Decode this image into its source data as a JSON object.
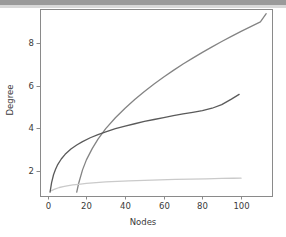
{
  "figure": {
    "background_color": "#ffffff",
    "top_band_color": "#9a9a9a",
    "axes_frame_color": "#8a8a8a"
  },
  "chart_data": {
    "type": "line",
    "title": "",
    "xlabel": "Nodes",
    "ylabel": "Degree",
    "xlim": [
      -4,
      116
    ],
    "ylim": [
      0.82,
      9.62
    ],
    "xticks": [
      0,
      20,
      40,
      60,
      80,
      100
    ],
    "xticklabels": [
      "0",
      "20",
      "40",
      "60",
      "80",
      "100"
    ],
    "yticks": [
      2,
      4,
      6,
      8
    ],
    "yticklabels": [
      "2",
      "4",
      "6",
      "8"
    ],
    "grid": false,
    "legend": null,
    "series": [
      {
        "name": "steep-curve",
        "color": "#848484",
        "linewidth": 1.3,
        "x": [
          15,
          16,
          18,
          20,
          23,
          26,
          30,
          35,
          40,
          45,
          50,
          55,
          60,
          65,
          70,
          75,
          80,
          85,
          90,
          95,
          100,
          105,
          110,
          113
        ],
        "y": [
          1.0,
          1.42,
          2.05,
          2.52,
          3.05,
          3.5,
          3.99,
          4.5,
          4.95,
          5.36,
          5.74,
          6.09,
          6.42,
          6.73,
          7.03,
          7.31,
          7.58,
          7.84,
          8.09,
          8.33,
          8.57,
          8.79,
          9.01,
          9.4
        ]
      },
      {
        "name": "dark-curve",
        "color": "#5a5a5a",
        "linewidth": 1.3,
        "x": [
          1.2,
          2,
          3,
          4,
          5,
          7,
          9,
          12,
          15,
          18,
          22,
          26,
          30,
          35,
          40,
          45,
          50,
          55,
          60,
          65,
          70,
          75,
          80,
          85,
          90,
          95,
          99
        ],
        "y": [
          1.0,
          1.45,
          1.82,
          2.07,
          2.27,
          2.56,
          2.78,
          3.03,
          3.22,
          3.38,
          3.56,
          3.71,
          3.84,
          3.99,
          4.11,
          4.22,
          4.33,
          4.42,
          4.51,
          4.6,
          4.68,
          4.76,
          4.84,
          4.95,
          5.12,
          5.38,
          5.6
        ]
      },
      {
        "name": "flat-curve",
        "color": "#cacaca",
        "linewidth": 1.3,
        "x": [
          2,
          3,
          4,
          6,
          8,
          10,
          13,
          16,
          20,
          25,
          30,
          36,
          42,
          50,
          58,
          66,
          74,
          82,
          90,
          96,
          100
        ],
        "y": [
          1.07,
          1.12,
          1.16,
          1.22,
          1.26,
          1.3,
          1.34,
          1.37,
          1.41,
          1.45,
          1.48,
          1.51,
          1.53,
          1.56,
          1.58,
          1.6,
          1.615,
          1.63,
          1.645,
          1.655,
          1.66
        ]
      }
    ]
  }
}
